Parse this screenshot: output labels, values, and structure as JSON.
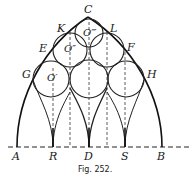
{
  "figure": {
    "caption": "Fig. 252.",
    "points": {
      "A": "A",
      "R": "R",
      "D": "D",
      "S": "S",
      "B": "B",
      "C": "C",
      "K": "K",
      "L": "L",
      "E": "E",
      "F": "F",
      "G": "G",
      "H": "H"
    },
    "centers": {
      "o1": "O′",
      "o2": "O″",
      "o3": "O‴"
    }
  }
}
